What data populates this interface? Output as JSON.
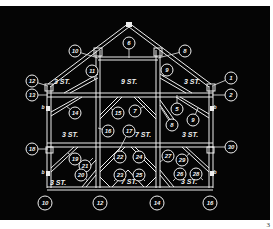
{
  "figure": {
    "page_number": "3",
    "colors": {
      "background": "#050505",
      "lines": "#f0f0f0",
      "paper": "#ffffff"
    }
  },
  "rooms": [
    {
      "id": "attic",
      "text": "9 ST.",
      "x": 129,
      "y": 84
    },
    {
      "id": "upper-left",
      "text": "3 ST.",
      "x": 62,
      "y": 84
    },
    {
      "id": "upper-right",
      "text": "3 ST.",
      "x": 192,
      "y": 84
    },
    {
      "id": "middle-left",
      "text": "3 ST.",
      "x": 70,
      "y": 137
    },
    {
      "id": "middle-center",
      "text": "7 ST.",
      "x": 143,
      "y": 137
    },
    {
      "id": "middle-right",
      "text": "3 ST.",
      "x": 190,
      "y": 137
    },
    {
      "id": "lower-left",
      "text": "3 ST.",
      "x": 58,
      "y": 185
    },
    {
      "id": "lower-center",
      "text": "7 ST.",
      "x": 129,
      "y": 184
    },
    {
      "id": "lower-right",
      "text": "3 ST.",
      "x": 189,
      "y": 184
    }
  ],
  "callouts": [
    {
      "num": "10",
      "cx": 75,
      "cy": 51,
      "tx": 98,
      "ty": 58
    },
    {
      "num": "6",
      "cx": 129,
      "cy": 43,
      "tx": 129,
      "ty": 58
    },
    {
      "num": "8",
      "cx": 185,
      "cy": 51,
      "tx": 158,
      "ty": 58
    },
    {
      "num": "11",
      "cx": 92,
      "cy": 71,
      "tx": 95,
      "ty": 80
    },
    {
      "num": "9",
      "cx": 167,
      "cy": 70,
      "tx": 163,
      "ty": 77
    },
    {
      "num": "12",
      "cx": 32,
      "cy": 81,
      "tx": 48,
      "ty": 86
    },
    {
      "num": "1",
      "cx": 231,
      "cy": 78,
      "tx": 212,
      "ty": 86
    },
    {
      "num": "13",
      "cx": 32,
      "cy": 95,
      "tx": 48,
      "ty": 95
    },
    {
      "num": "2",
      "cx": 231,
      "cy": 95,
      "tx": 212,
      "ty": 95
    },
    {
      "num": "14",
      "cx": 75,
      "cy": 113,
      "tx": 66,
      "ty": 106
    },
    {
      "num": "15",
      "cx": 118,
      "cy": 113,
      "tx": 110,
      "ty": 108
    },
    {
      "num": "7",
      "cx": 135,
      "cy": 111,
      "tx": 145,
      "ty": 106
    },
    {
      "num": "5",
      "cx": 177,
      "cy": 109,
      "tx": 177,
      "ty": 95
    },
    {
      "num": "8",
      "cx": 172,
      "cy": 125,
      "tx": 161,
      "ty": 108
    },
    {
      "num": "9",
      "cx": 193,
      "cy": 120,
      "tx": 198,
      "ty": 108
    },
    {
      "num": "16",
      "cx": 108,
      "cy": 131,
      "tx": 98,
      "ty": 128
    },
    {
      "num": "17",
      "cx": 129,
      "cy": 131,
      "tx": 118,
      "ty": 152
    },
    {
      "num": "18",
      "cx": 32,
      "cy": 149,
      "tx": 48,
      "ty": 149
    },
    {
      "num": "30",
      "cx": 231,
      "cy": 147,
      "tx": 212,
      "ty": 147
    },
    {
      "num": "19",
      "cx": 75,
      "cy": 159,
      "tx": 68,
      "ty": 153
    },
    {
      "num": "21",
      "cx": 85,
      "cy": 166,
      "tx": 93,
      "ty": 158
    },
    {
      "num": "20",
      "cx": 81,
      "cy": 175,
      "tx": 88,
      "ty": 181
    },
    {
      "num": "22",
      "cx": 120,
      "cy": 157,
      "tx": 120,
      "ty": 157
    },
    {
      "num": "24",
      "cx": 139,
      "cy": 157,
      "tx": 139,
      "ty": 157
    },
    {
      "num": "23",
      "cx": 120,
      "cy": 175,
      "tx": 114,
      "ty": 181
    },
    {
      "num": "25",
      "cx": 139,
      "cy": 175,
      "tx": 145,
      "ty": 181
    },
    {
      "num": "27",
      "cx": 168,
      "cy": 156,
      "tx": 160,
      "ty": 162
    },
    {
      "num": "29",
      "cx": 182,
      "cy": 160,
      "tx": 190,
      "ty": 153
    },
    {
      "num": "26",
      "cx": 180,
      "cy": 174,
      "tx": 173,
      "ty": 181
    },
    {
      "num": "28",
      "cx": 196,
      "cy": 174,
      "tx": 203,
      "ty": 180
    }
  ],
  "axis_markers": [
    {
      "num": "10",
      "cx": 45,
      "cy": 203
    },
    {
      "num": "12",
      "cx": 100,
      "cy": 203
    },
    {
      "num": "14",
      "cx": 157,
      "cy": 203
    },
    {
      "num": "16",
      "cx": 210,
      "cy": 203
    }
  ],
  "side_marks": [
    {
      "text": "b",
      "x": 43,
      "y": 109
    },
    {
      "text": "b",
      "x": 215,
      "y": 109
    },
    {
      "text": "b",
      "x": 43,
      "y": 174
    },
    {
      "text": "b",
      "x": 215,
      "y": 174
    }
  ]
}
